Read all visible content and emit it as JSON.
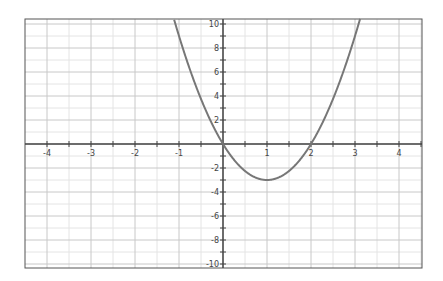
{
  "chart_data": {
    "type": "line",
    "title": "",
    "xlabel": "",
    "ylabel": "",
    "function": "y = 3x^2 - 6x",
    "xlim": [
      -4.5,
      4.5
    ],
    "ylim": [
      -10.5,
      10.5
    ],
    "grid": true,
    "legend": null,
    "x_ticks": [
      -4,
      -3,
      -2,
      -1,
      0,
      1,
      2,
      3,
      4
    ],
    "x_tick_labels": [
      "-4",
      "-3",
      "-2",
      "-1",
      "",
      "1",
      "2",
      "3",
      "4"
    ],
    "y_ticks": [
      -10,
      -8,
      -6,
      -4,
      -2,
      2,
      4,
      6,
      8,
      10
    ],
    "y_tick_labels": [
      "-10",
      "-8",
      "-6",
      "-4",
      "-2",
      "2",
      "4",
      "6",
      "8",
      "10"
    ],
    "series": [
      {
        "name": "parabola",
        "x": [
          -1.1,
          -1,
          -0.5,
          0,
          0.5,
          1,
          1.5,
          2,
          2.5,
          3,
          3.1
        ],
        "y": [
          10.23,
          9,
          3.75,
          0,
          -2.25,
          -3,
          -2.25,
          0,
          3.75,
          9,
          10.23
        ]
      }
    ],
    "key_points": {
      "vertex": [
        1,
        -3
      ],
      "roots": [
        0,
        2
      ]
    }
  },
  "colors": {
    "curve": "#777777",
    "axis": "#444444",
    "major_grid": "#c8c8c8",
    "minor_grid": "#e4e4e4",
    "frame": "#555555"
  }
}
